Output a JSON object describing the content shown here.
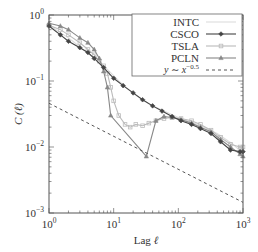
{
  "chart_data": {
    "type": "line",
    "title": "",
    "xlabel": "Lag ℓ",
    "ylabel": "C (ℓ)",
    "xscale": "log",
    "yscale": "log",
    "xlim": [
      1,
      1000
    ],
    "ylim": [
      0.001,
      1
    ],
    "x_ticks": [
      {
        "value": 1,
        "base": "10",
        "exp": "0"
      },
      {
        "value": 10,
        "base": "10",
        "exp": "1"
      },
      {
        "value": 100,
        "base": "10",
        "exp": "2"
      },
      {
        "value": 1000,
        "base": "10",
        "exp": "3"
      }
    ],
    "y_ticks": [
      {
        "value": 1,
        "base": "10",
        "exp": "0"
      },
      {
        "value": 0.1,
        "base": "10",
        "exp": "−1"
      },
      {
        "value": 0.01,
        "base": "10",
        "exp": "−2"
      },
      {
        "value": 0.001,
        "base": "10",
        "exp": "−3"
      }
    ],
    "grid": false,
    "legend_position": "upper right",
    "series": [
      {
        "name": "INTC",
        "color": "#dddddd",
        "marker": "none",
        "x": [
          1,
          2,
          3,
          5,
          8,
          12,
          20,
          35,
          60,
          100,
          200,
          400,
          700,
          1000
        ],
        "values": [
          0.7,
          0.45,
          0.33,
          0.22,
          0.15,
          0.1,
          0.065,
          0.045,
          0.035,
          0.028,
          0.022,
          0.016,
          0.011,
          0.008
        ]
      },
      {
        "name": "CSCO",
        "color": "#444444",
        "marker": "diamond",
        "x": [
          1,
          1.5,
          2,
          3,
          4,
          5,
          7,
          10,
          14,
          20,
          28,
          40,
          56,
          80,
          110,
          160,
          220,
          320,
          450,
          640,
          900,
          1000
        ],
        "values": [
          0.68,
          0.5,
          0.4,
          0.32,
          0.27,
          0.22,
          0.16,
          0.11,
          0.085,
          0.066,
          0.052,
          0.042,
          0.035,
          0.029,
          0.025,
          0.022,
          0.019,
          0.016,
          0.012,
          0.009,
          0.0085,
          0.0085
        ]
      },
      {
        "name": "TSLA",
        "color": "#bbbbbb",
        "marker": "square",
        "x": [
          1,
          1.5,
          2,
          3,
          4,
          5,
          6,
          7,
          8,
          9,
          10,
          12,
          15,
          18,
          22,
          28,
          35,
          45,
          60,
          80,
          110,
          160,
          220,
          320,
          450,
          640,
          900,
          1000
        ],
        "values": [
          0.7,
          0.6,
          0.5,
          0.38,
          0.3,
          0.25,
          0.2,
          0.17,
          0.13,
          0.08,
          0.05,
          0.03,
          0.022,
          0.02,
          0.022,
          0.021,
          0.023,
          0.025,
          0.027,
          0.028,
          0.027,
          0.025,
          0.022,
          0.018,
          0.014,
          0.011,
          0.01,
          0.01
        ]
      },
      {
        "name": "PCLN",
        "color": "#888888",
        "marker": "triangle",
        "x": [
          1,
          1.5,
          2,
          3,
          4,
          5,
          6,
          7,
          8,
          9,
          32,
          45,
          60,
          80,
          110,
          160,
          220,
          320,
          450,
          640,
          900,
          1000
        ],
        "values": [
          0.75,
          0.68,
          0.6,
          0.45,
          0.38,
          0.3,
          0.22,
          0.14,
          0.08,
          0.03,
          0.0072,
          0.025,
          0.029,
          0.028,
          0.026,
          0.023,
          0.02,
          0.017,
          0.013,
          0.01,
          0.0078,
          0.0072
        ]
      },
      {
        "name": "y ~ x^−0.5",
        "color": "#555555",
        "marker": "none",
        "style": "dashed",
        "x": [
          1,
          1000
        ],
        "values": [
          0.046,
          0.00145
        ]
      }
    ]
  },
  "legend": {
    "items": [
      {
        "label": "INTC"
      },
      {
        "label": "CSCO"
      },
      {
        "label": "TSLA"
      },
      {
        "label": "PCLN"
      },
      {
        "label_y": "y",
        "label_sim": "∼",
        "label_x": "x",
        "label_exp": "−0.5"
      }
    ]
  },
  "axes": {
    "xlabel_text": "Lag ",
    "xlabel_var": "ℓ",
    "ylabel_text": "C (ℓ)"
  }
}
